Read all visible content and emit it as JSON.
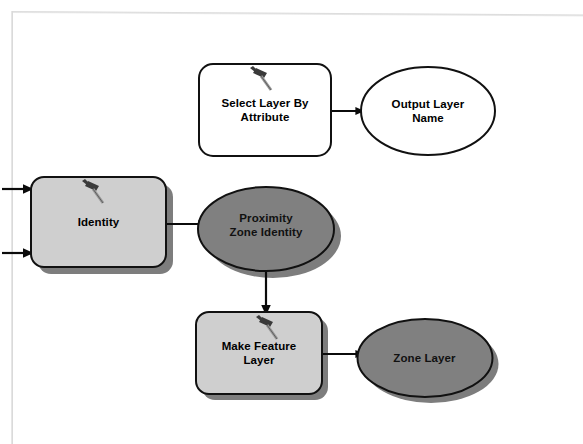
{
  "diagram": {
    "colors": {
      "process_fill": "#cfcfcf",
      "process_fill_white": "#ffffff",
      "data_fill_dark": "#808080",
      "data_fill_white": "#ffffff",
      "outline": "#000000",
      "shadow": "#7a7a7a",
      "frame": "#dcdcdc",
      "background": "#ffffff"
    },
    "nodes": [
      {
        "id": "select-layer-by-attribute",
        "name": "select-layer-by-attribute",
        "label": "Select Layer By\nAttribute",
        "shape": "rounded-rect",
        "kind": "tool",
        "state": "not-ready",
        "fill": "#ffffff",
        "shadow": false,
        "icon": "hammer-icon",
        "x": 199,
        "y": 64,
        "width": 132,
        "height": 92
      },
      {
        "id": "output-layer-name",
        "name": "output-layer-name",
        "label": "Output Layer\nName",
        "shape": "ellipse",
        "kind": "data",
        "state": "not-ready",
        "fill": "#ffffff",
        "shadow": false,
        "icon": null,
        "x": 361,
        "y": 67,
        "width": 134,
        "height": 88
      },
      {
        "id": "identity",
        "name": "identity",
        "label": "Identity",
        "shape": "rounded-rect",
        "kind": "tool",
        "state": "ready",
        "fill": "#cfcfcf",
        "shadow": true,
        "icon": "hammer-icon",
        "x": 31,
        "y": 177,
        "width": 135,
        "height": 90
      },
      {
        "id": "proximity-zone-identity",
        "name": "proximity-zone-identity",
        "label": "Proximity\nZone Identity",
        "shape": "ellipse",
        "kind": "data",
        "state": "ready",
        "fill": "#808080",
        "shadow": true,
        "icon": null,
        "x": 198,
        "y": 187,
        "width": 136,
        "height": 84
      },
      {
        "id": "make-feature-layer",
        "name": "make-feature-layer",
        "label": "Make Feature\nLayer",
        "shape": "rounded-rect",
        "kind": "tool",
        "state": "ready",
        "fill": "#cfcfcf",
        "shadow": true,
        "icon": "hammer-icon",
        "x": 196,
        "y": 312,
        "width": 126,
        "height": 82
      },
      {
        "id": "zone-layer",
        "name": "zone-layer",
        "label": "Zone Layer",
        "shape": "ellipse",
        "kind": "data",
        "state": "ready",
        "fill": "#808080",
        "shadow": true,
        "icon": null,
        "x": 357,
        "y": 319,
        "width": 135,
        "height": 78
      }
    ],
    "connectors": [
      {
        "name": "connector-input-top-to-identity",
        "from": "canvas-edge-left",
        "to": "identity",
        "direction": "right"
      },
      {
        "name": "connector-input-bottom-to-identity",
        "from": "canvas-edge-left",
        "to": "identity",
        "direction": "right"
      },
      {
        "name": "connector-select-layer-to-output-layer",
        "from": "select-layer-by-attribute",
        "to": "output-layer-name",
        "direction": "right"
      },
      {
        "name": "connector-identity-to-proximity-zone",
        "from": "identity",
        "to": "proximity-zone-identity",
        "direction": "right"
      },
      {
        "name": "connector-proximity-zone-to-make-feature-layer",
        "from": "proximity-zone-identity",
        "to": "make-feature-layer",
        "direction": "down"
      },
      {
        "name": "connector-make-feature-layer-to-zone-layer",
        "from": "make-feature-layer",
        "to": "zone-layer",
        "direction": "right"
      }
    ]
  }
}
